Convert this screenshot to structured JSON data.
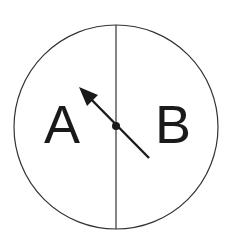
{
  "diagram": {
    "type": "spinner",
    "colors": {
      "background": "#ffffff",
      "stroke": "#333333",
      "text": "#1a1a1a",
      "arrow": "#1a1a1a"
    },
    "circle": {
      "cx": 116,
      "cy": 127,
      "r": 102
    },
    "divider": {
      "x": 116,
      "y1": 25,
      "y2": 229
    },
    "sections": [
      {
        "id": "left",
        "label": "A"
      },
      {
        "id": "right",
        "label": "B"
      }
    ],
    "arrow": {
      "pivot": {
        "x": 116,
        "y": 126
      },
      "tip": {
        "x": 79,
        "y": 87
      },
      "tail": {
        "x": 149,
        "y": 158
      }
    }
  }
}
